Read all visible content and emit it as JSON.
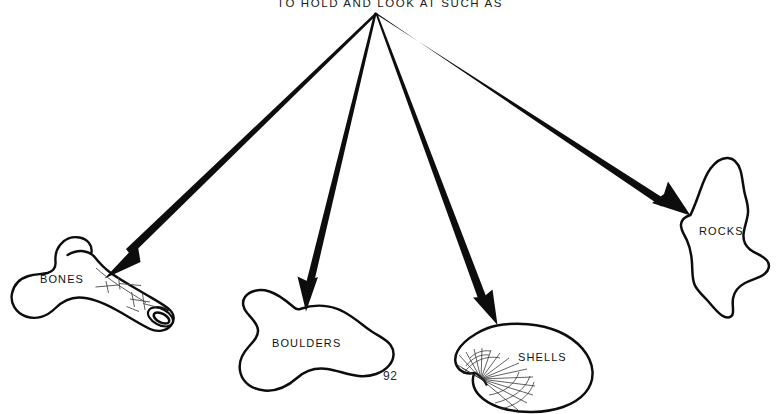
{
  "page": {
    "background_color": "#ffffff",
    "ink_color": "#0d0d0d",
    "width": 780,
    "height": 414,
    "folio": "92"
  },
  "header": {
    "text": "TO HOLD AND LOOK AT SUCH AS",
    "clipped_at_top": true
  },
  "diagram": {
    "type": "radial-fanout",
    "hub": {
      "x": 375,
      "y": 13
    },
    "arrow_count": 4,
    "arrows": [
      {
        "target": "BONES",
        "tip_x": 105,
        "tip_y": 278,
        "direction": "down-left"
      },
      {
        "target": "BOULDERS",
        "tip_x": 306,
        "tip_y": 311,
        "direction": "down"
      },
      {
        "target": "SHELLS",
        "tip_x": 497,
        "tip_y": 325,
        "direction": "down-right"
      },
      {
        "target": "ROCKS",
        "tip_x": 690,
        "tip_y": 215,
        "direction": "down-right"
      }
    ],
    "objects": [
      {
        "id": "bones",
        "label": "BONES",
        "label_x": 40,
        "label_y": 280,
        "icon": "bone-icon",
        "description": "long bone with hatched shading and hollow marrow end"
      },
      {
        "id": "boulders",
        "label": "BOULDERS",
        "label_x": 272,
        "label_y": 344,
        "icon": "boulder-icon",
        "description": "rounded kidney-shaped boulder outline"
      },
      {
        "id": "shells",
        "label": "SHELLS",
        "label_x": 518,
        "label_y": 358,
        "icon": "shell-icon",
        "description": "clam shell with radiating ribs from umbo hinge"
      },
      {
        "id": "rocks",
        "label": "ROCKS",
        "label_x": 699,
        "label_y": 231,
        "icon": "rock-icon",
        "description": "angular irregular rock outline"
      }
    ]
  }
}
